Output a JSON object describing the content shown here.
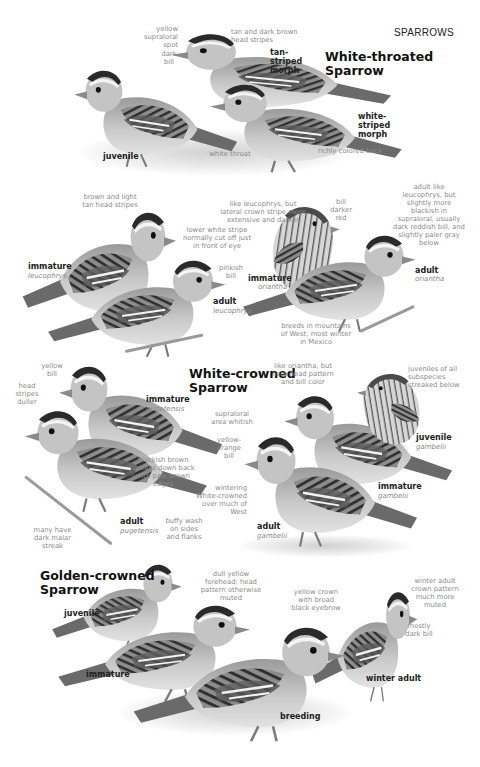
{
  "page": {
    "header": "SPARROWS"
  },
  "white_throated": {
    "title_line1": "White-throated",
    "title_line2": "Sparrow",
    "labels": {
      "tan_striped": "tan-striped morph",
      "white_striped": "white-striped morph",
      "juvenile": "juvenile"
    },
    "notes": {
      "yellow_supraloral": "yellow supraloral spot",
      "dark_bill": "dark bill",
      "tan_dark_stripes": "tan and dark brown head stripes",
      "white_throat": "white throat",
      "richly_colored_back": "richly colored back"
    }
  },
  "white_crowned": {
    "title_line1": "White-crowned",
    "title_line2": "Sparrow",
    "labels": {
      "immature_leucophrys": "immature",
      "immature_leucophrys_sub": "leucophrys",
      "adult_leucophrys": "adult",
      "adult_leucophrys_sub": "leucophrys",
      "immature_oriantha": "immature",
      "immature_oriantha_sub": "oriantha",
      "adult_oriantha": "adult",
      "adult_oriantha_sub": "oriantha",
      "immature_pugetensis": "immature",
      "immature_pugetensis_sub": "pugetensis",
      "adult_pugetensis": "adult",
      "adult_pugetensis_sub": "pugetensis",
      "adult_gambelii": "adult",
      "adult_gambelii_sub": "gambelii",
      "immature_gambelii": "immature",
      "immature_gambelii_sub": "gambelii",
      "juvenile_gambelii": "juvenile",
      "juvenile_gambelii_sub": "gambelii"
    },
    "notes": {
      "brown_light_tan": "brown and light tan head stripes",
      "like_leucophrys_lateral": "like leucophrys, but lateral crown stripe more extensive and darker",
      "lower_white_stripe": "lower white stripe normally cut off just in front of eye",
      "pinkish_bill": "pinkish bill",
      "bill_darker_red": "bill darker red",
      "adult_like_leucophrys": "adult like leucophrys, but slightly more blackish in supraloral, usually dark reddish bill, and slightly paler gray below",
      "breeds_mountains": "breeds in mountains of West; most winter in Mexico",
      "yellow_bill": "yellow bill",
      "head_stripes_duller": "head stripes duller",
      "blackish_brown_streaks": "blackish brown streaks down back with pale brown edges",
      "many_dark_malar": "many have dark malar streak",
      "buffy_wash": "buffy wash on sides and flanks",
      "like_oriantha_note": "like oriantha, but note head pattern and bill color",
      "juveniles_all_subspecies": "juveniles of all subspecies streaked below",
      "supraloral_whitish": "supraloral area whitish",
      "yellow_orange_bill": "yellow-orange bill",
      "wintering_white_crowned": "wintering White-crowned over much of West"
    }
  },
  "golden_crowned": {
    "title_line1": "Golden-crowned",
    "title_line2": "Sparrow",
    "labels": {
      "juvenile": "juvenile",
      "immature": "immature",
      "breeding": "breeding",
      "winter_adult": "winter adult"
    },
    "notes": {
      "dull_yellow_forehead": "dull yellow forehead; head pattern otherwise muted",
      "yellow_crown": "yellow crown with broad black eyebrow",
      "winter_adult_crown": "winter adult crown pattern much more muted",
      "mostly_dark_bill": "mostly dark bill"
    }
  },
  "colors": {
    "title": "#111111",
    "note_text": "#8a8a8a",
    "bird_body": "#b8b8b8",
    "bird_dark": "#3a3a3a",
    "background": "#ffffff"
  }
}
